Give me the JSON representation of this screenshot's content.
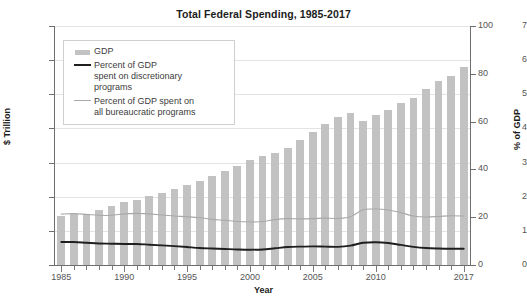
{
  "chart_data": {
    "type": "bar",
    "title": "Total Federal Spending, 1985-2017",
    "xlabel": "Year",
    "ylabel": "$ Trillion",
    "ylabel_secondary": "% of GDP",
    "grid": true,
    "legend_position": "upper left",
    "x": [
      1985,
      1986,
      1987,
      1988,
      1989,
      1990,
      1991,
      1992,
      1993,
      1994,
      1995,
      1996,
      1997,
      1998,
      1999,
      2000,
      2001,
      2002,
      2003,
      2004,
      2005,
      2006,
      2007,
      2008,
      2009,
      2010,
      2011,
      2012,
      2013,
      2014,
      2015,
      2016,
      2017
    ],
    "xtick_labels": [
      "1985",
      "1990",
      "1995",
      "2000",
      "2005",
      "2010",
      "2017"
    ],
    "xtick_values": [
      1985,
      1990,
      1995,
      2000,
      2005,
      2010,
      2017
    ],
    "ylim": [
      0,
      7
    ],
    "ytick_values": [
      0,
      1,
      2,
      3,
      4,
      5,
      6,
      7
    ],
    "ytick_labels": [
      "0",
      "1",
      "2",
      "3",
      "4",
      "5",
      "6",
      "7"
    ],
    "ylim_secondary": [
      0,
      100
    ],
    "ytick_values_secondary": [
      0,
      20,
      40,
      60,
      80,
      100
    ],
    "ytick_labels_secondary": [
      "0",
      "20",
      "40",
      "60",
      "80",
      "100"
    ],
    "series": [
      {
        "name": "GDP",
        "kind": "bar",
        "axis": "left",
        "unit": "$ Trillion",
        "color": "#c2c2c2",
        "values": [
          1.45,
          1.5,
          1.5,
          1.62,
          1.74,
          1.84,
          1.9,
          2.02,
          2.1,
          2.22,
          2.34,
          2.46,
          2.6,
          2.74,
          2.89,
          3.07,
          3.18,
          3.27,
          3.42,
          3.65,
          3.89,
          4.14,
          4.34,
          4.45,
          4.23,
          4.39,
          4.55,
          4.74,
          4.9,
          5.15,
          5.38,
          5.55,
          5.8
        ],
        "note": "bar heights read against left axis ($ Trillion); equivalently 0-100 on right axis"
      },
      {
        "name": "Percent of GDP spent on discretionary programs",
        "kind": "line",
        "axis": "right",
        "unit": "% of GDP",
        "color": "#1f1f1f",
        "values": [
          9.6,
          9.6,
          9.3,
          9.0,
          8.9,
          8.8,
          8.8,
          8.5,
          8.2,
          7.9,
          7.5,
          7.1,
          6.9,
          6.7,
          6.5,
          6.4,
          6.5,
          7.0,
          7.5,
          7.7,
          7.8,
          7.7,
          7.6,
          8.1,
          9.3,
          9.5,
          9.2,
          8.4,
          7.6,
          7.1,
          6.9,
          6.8,
          6.8
        ]
      },
      {
        "name": "Percent of GDP spent on all bureaucratic programs",
        "kind": "line",
        "axis": "right",
        "unit": "% of GDP",
        "color": "#a8a8a8",
        "values": [
          21.3,
          21.5,
          21.2,
          20.8,
          20.8,
          21.4,
          21.6,
          21.4,
          20.9,
          20.5,
          20.2,
          19.8,
          19.1,
          18.7,
          18.2,
          18.0,
          18.2,
          19.0,
          19.4,
          19.3,
          19.4,
          19.6,
          19.5,
          20.2,
          23.1,
          23.4,
          23.0,
          21.9,
          20.5,
          20.1,
          20.3,
          20.6,
          20.5
        ]
      }
    ]
  },
  "legend": {
    "entries": [
      {
        "label": "GDP",
        "swatch": "patch-grey"
      },
      {
        "label": "Percent of GDP\nspent on discretionary\nprograms",
        "swatch": "line-dark"
      },
      {
        "label": "Percent of GDP spent on\nall bureaucratic programs",
        "swatch": "line-grey"
      }
    ]
  },
  "colors": {
    "bar": "#c2c2c2",
    "line_discretionary": "#1f1f1f",
    "line_bureaucratic": "#a8a8a8",
    "grid": "#e3e3e3",
    "axis": "#6e6e6e",
    "background": "#ffffff"
  }
}
